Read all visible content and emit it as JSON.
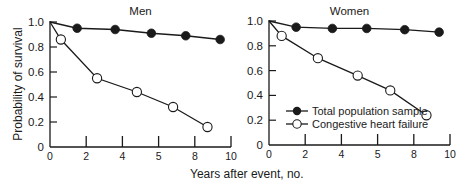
{
  "chart_data": [
    {
      "type": "line",
      "title": "Men",
      "xlabel": "Years after event, no.",
      "ylabel": "Probability of survival",
      "xlim": [
        0,
        10
      ],
      "ylim": [
        0,
        1.0
      ],
      "x_ticks": [
        0,
        2,
        4,
        6,
        8,
        10
      ],
      "x_tick_labels": [
        "0",
        "2",
        "4",
        "5",
        "8",
        "10"
      ],
      "y_ticks": [
        0,
        0.2,
        0.4,
        0.6,
        0.8,
        1.0
      ],
      "y_tick_labels": [
        "0",
        "0.2",
        "0.4",
        "0.6",
        "0.8",
        "1.0"
      ],
      "grid": false,
      "series": [
        {
          "name": "Total population sample",
          "marker": "filled-circle",
          "x": [
            0,
            1.5,
            3.6,
            5.6,
            7.5,
            9.4
          ],
          "y": [
            1.0,
            0.95,
            0.94,
            0.91,
            0.89,
            0.86
          ]
        },
        {
          "name": "Congestive heart failure",
          "marker": "open-circle",
          "x": [
            0,
            0.6,
            2.6,
            4.8,
            6.8,
            8.7
          ],
          "y": [
            1.0,
            0.86,
            0.55,
            0.44,
            0.32,
            0.16
          ]
        }
      ]
    },
    {
      "type": "line",
      "title": "Women",
      "xlabel": "Years after event, no.",
      "ylabel": "Probability of survival",
      "xlim": [
        0,
        10
      ],
      "ylim": [
        0,
        1.0
      ],
      "x_ticks": [
        0,
        2,
        4,
        6,
        8,
        10
      ],
      "x_tick_labels": [
        "0",
        "2",
        "4",
        "5",
        "8",
        "10"
      ],
      "y_ticks": [
        0,
        0.2,
        0.4,
        0.6,
        0.8,
        1.0
      ],
      "y_tick_labels": [
        "0",
        "0.2",
        "0.4",
        "0.6",
        "0.8",
        "1.0"
      ],
      "grid": false,
      "legend_position": "lower-left inside",
      "series": [
        {
          "name": "Total population sample",
          "marker": "filled-circle",
          "x": [
            0,
            1.5,
            3.5,
            5.4,
            7.5,
            9.4
          ],
          "y": [
            1.0,
            0.95,
            0.94,
            0.94,
            0.93,
            0.91
          ]
        },
        {
          "name": "Congestive heart failure",
          "marker": "open-circle",
          "x": [
            0,
            0.7,
            2.7,
            4.9,
            6.7,
            8.7
          ],
          "y": [
            1.0,
            0.88,
            0.7,
            0.56,
            0.44,
            0.24
          ]
        }
      ]
    }
  ],
  "labels": {
    "ylabel": "Probability of survival",
    "xlabel": "Years after event, no.",
    "legend_filled": "Total population sample",
    "legend_open": "Congestive heart failure",
    "panel_left_title": "Men",
    "panel_right_title": "Women"
  },
  "colors": {
    "ink": "#1a1a1a",
    "background": "#ffffff"
  }
}
